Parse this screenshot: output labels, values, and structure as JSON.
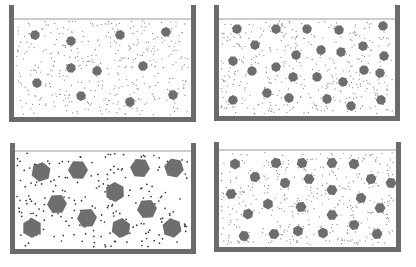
{
  "figure": {
    "colors": {
      "wall": "#6b6b6b",
      "waterline": "#9a9a9a",
      "particle": "#6e6e6e",
      "solvent_dot": "#555555",
      "background": "#ffffff"
    },
    "panels": [
      {
        "id": "top-left",
        "container": {
          "x": 9,
          "top": 5,
          "right": 196,
          "bottom": 122,
          "waterline": 19
        },
        "particle_shape": "small-circle",
        "particle_radius": 5,
        "particle_count": 11,
        "particles": [
          [
            35,
            35
          ],
          [
            71,
            41
          ],
          [
            120,
            35
          ],
          [
            166,
            32
          ],
          [
            71,
            68
          ],
          [
            97,
            71
          ],
          [
            143,
            66
          ],
          [
            37,
            83
          ],
          [
            81,
            96
          ],
          [
            130,
            102
          ],
          [
            173,
            95
          ]
        ]
      },
      {
        "id": "top-right",
        "container": {
          "x": 214,
          "top": 5,
          "right": 400,
          "bottom": 121,
          "waterline": 19
        },
        "particle_shape": "small-circle",
        "particle_radius": 5,
        "particle_count": 25,
        "particles": [
          [
            237,
            29
          ],
          [
            276,
            29
          ],
          [
            307,
            29
          ],
          [
            339,
            30
          ],
          [
            383,
            26
          ],
          [
            255,
            45
          ],
          [
            296,
            55
          ],
          [
            321,
            50
          ],
          [
            341,
            52
          ],
          [
            363,
            46
          ],
          [
            384,
            56
          ],
          [
            233,
            61
          ],
          [
            252,
            71
          ],
          [
            276,
            67
          ],
          [
            293,
            77
          ],
          [
            317,
            77
          ],
          [
            343,
            82
          ],
          [
            364,
            70
          ],
          [
            380,
            73
          ],
          [
            267,
            93
          ],
          [
            289,
            98
          ],
          [
            327,
            99
          ],
          [
            351,
            106
          ],
          [
            381,
            100
          ],
          [
            233,
            100
          ]
        ]
      },
      {
        "id": "bottom-left",
        "container": {
          "x": 10,
          "top": 143,
          "right": 196,
          "bottom": 254,
          "waterline": 151
        },
        "particle_shape": "large-hexagon",
        "particle_radius": 10,
        "particle_count": 11,
        "particles": [
          [
            41,
            172
          ],
          [
            78,
            170
          ],
          [
            140,
            168
          ],
          [
            174,
            168
          ],
          [
            115,
            192
          ],
          [
            57,
            204
          ],
          [
            147,
            209
          ],
          [
            87,
            218
          ],
          [
            32,
            228
          ],
          [
            121,
            228
          ],
          [
            172,
            228
          ]
        ]
      },
      {
        "id": "bottom-right",
        "container": {
          "x": 214,
          "top": 142,
          "right": 401,
          "bottom": 252,
          "waterline": 150
        },
        "particle_shape": "small-hexagon",
        "particle_radius": 5.5,
        "particle_count": 24,
        "particles": [
          [
            235,
            164
          ],
          [
            276,
            163
          ],
          [
            302,
            163
          ],
          [
            332,
            163
          ],
          [
            354,
            164
          ],
          [
            255,
            177
          ],
          [
            285,
            183
          ],
          [
            309,
            179
          ],
          [
            371,
            179
          ],
          [
            391,
            183
          ],
          [
            231,
            194
          ],
          [
            332,
            190
          ],
          [
            361,
            198
          ],
          [
            268,
            204
          ],
          [
            301,
            207
          ],
          [
            380,
            208
          ],
          [
            248,
            214
          ],
          [
            332,
            215
          ],
          [
            354,
            225
          ],
          [
            244,
            236
          ],
          [
            274,
            234
          ],
          [
            298,
            231
          ],
          [
            323,
            233
          ],
          [
            377,
            234
          ]
        ]
      }
    ]
  }
}
